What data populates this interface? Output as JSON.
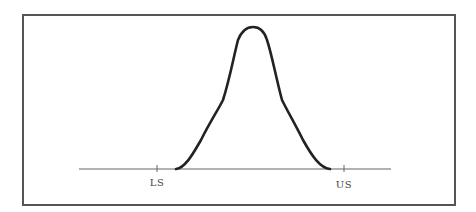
{
  "diagram": {
    "type": "normal-distribution-with-spec-limits",
    "labels": {
      "lower_spec": "LS",
      "upper_spec": "US"
    },
    "colors": {
      "curve": "#222222",
      "axis": "#666666",
      "frame": "#555555",
      "text": "#444444"
    }
  }
}
